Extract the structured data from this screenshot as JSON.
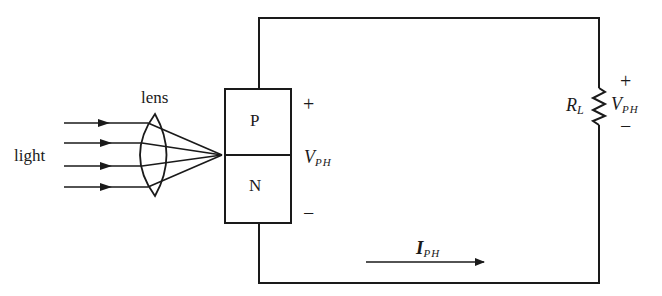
{
  "diagram": {
    "type": "photodiode-circuit",
    "labels": {
      "light": "light",
      "lens": "lens",
      "p_region": "P",
      "n_region": "N",
      "diode_plus": "+",
      "diode_minus": "−",
      "diode_voltage_main": "V",
      "diode_voltage_sub": "PH",
      "resistor_main": "R",
      "resistor_sub": "L",
      "resistor_plus": "+",
      "resistor_minus": "−",
      "resistor_voltage_main": "V",
      "resistor_voltage_sub": "PH",
      "current_main": "I",
      "current_sub": "PH"
    },
    "components": [
      {
        "id": "light-rays",
        "count": 4
      },
      {
        "id": "lens",
        "kind": "convex"
      },
      {
        "id": "pn-junction",
        "regions": [
          "P",
          "N"
        ]
      },
      {
        "id": "load-resistor",
        "name": "RL"
      },
      {
        "id": "current-arrow",
        "direction": "right"
      }
    ],
    "colors": {
      "line": "#1a1a1a",
      "background": "#ffffff"
    }
  }
}
